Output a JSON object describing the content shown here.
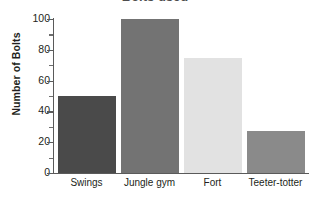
{
  "chart_data": {
    "type": "bar",
    "title": "Bolts used",
    "xlabel": "",
    "ylabel": "Number of Bolts",
    "categories": [
      "Swings",
      "Jungle gym",
      "Fort",
      "Teeter-totter"
    ],
    "values": [
      50,
      100,
      75,
      27
    ],
    "colors": [
      "#4a4a4a",
      "#737373",
      "#e2e2e2",
      "#8a8a8a"
    ],
    "ylim": [
      0,
      100
    ],
    "ytick_labels": [
      "100",
      "80",
      "60",
      "40",
      "20",
      "0"
    ],
    "ytick_values": [
      100,
      80,
      60,
      40,
      20,
      0
    ],
    "yminor_values": [
      90,
      70,
      50,
      30,
      10
    ],
    "grid": false,
    "legend": "none",
    "axis_color": "#5a5a5a",
    "text_color": "#231f20"
  }
}
